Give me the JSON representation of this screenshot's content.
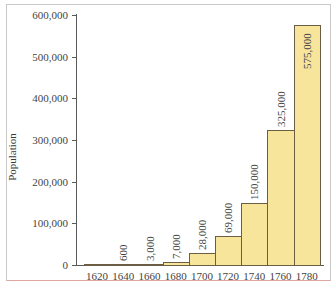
{
  "chart_data": {
    "type": "bar",
    "title": "",
    "xlabel": "",
    "ylabel": "Population",
    "ylim": [
      0,
      600000
    ],
    "yticks": [
      0,
      100000,
      200000,
      300000,
      400000,
      500000,
      600000
    ],
    "ytick_labels": [
      "0",
      "100,000",
      "200,000",
      "300,000",
      "400,000",
      "500,000",
      "600,000"
    ],
    "categories": [
      "1620",
      "1640",
      "1660",
      "1680",
      "1700",
      "1720",
      "1740",
      "1760",
      "1780"
    ],
    "values": [
      0,
      600,
      3000,
      7000,
      28000,
      69000,
      150000,
      325000,
      575000
    ],
    "data_labels": [
      "",
      "600",
      "3,000",
      "7,000",
      "28,000",
      "69,000",
      "150,000",
      "325,000",
      "575,000"
    ],
    "grid": false,
    "legend": null,
    "colors": {
      "bar_fill": "#f8e59c",
      "bar_edge": "#6b5e45",
      "axis": "#5a5a5a"
    }
  }
}
